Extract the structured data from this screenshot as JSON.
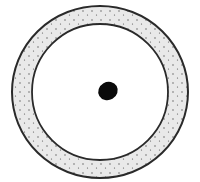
{
  "diagram": {
    "type": "ring-with-center-dot",
    "canvas": {
      "width": 200,
      "height": 182
    },
    "colors": {
      "background": "#ffffff",
      "band_fill": "#e9e9e9",
      "stroke": "#2a2a2a",
      "stipple": "#555555",
      "center_dot": "#0a0a0a"
    },
    "outer_ring": {
      "cx": 100,
      "cy": 92,
      "rx": 88,
      "ry": 86
    },
    "inner_ring": {
      "cx": 100,
      "cy": 92,
      "rx": 68,
      "ry": 68
    },
    "center_dot": {
      "cx": 108,
      "cy": 91,
      "rx": 10,
      "ry": 9,
      "rotate": -30
    }
  }
}
